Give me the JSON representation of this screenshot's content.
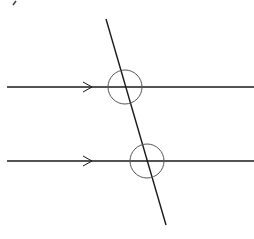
{
  "diagram": {
    "colors": {
      "line": "#1a1a1a",
      "circle": "#555555",
      "background": "#ffffff"
    },
    "parallel_lines": [
      {
        "id": "top",
        "y": 87,
        "x1": 7,
        "x2": 254,
        "arrow_x": 92
      },
      {
        "id": "bottom",
        "y": 161,
        "x1": 7,
        "x2": 254,
        "arrow_x": 92
      }
    ],
    "transversal": {
      "x1": 106,
      "y1": 19,
      "x2": 166,
      "y2": 225
    },
    "angle_circles": [
      {
        "cx": 125,
        "cy": 87,
        "r": 17
      },
      {
        "cx": 147,
        "cy": 161,
        "r": 17
      }
    ]
  }
}
